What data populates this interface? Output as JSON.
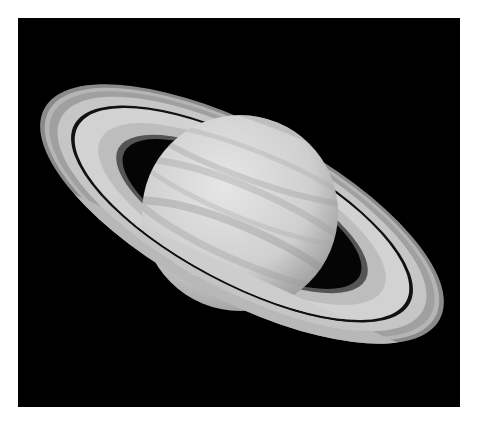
{
  "image": {
    "subject": "Saturn with rings",
    "background_color": "#000000",
    "page_color": "#ffffff",
    "planet_color": "#d8d8d8",
    "ring_color": "#c8c8c8",
    "storm_color": "#ffffff"
  }
}
